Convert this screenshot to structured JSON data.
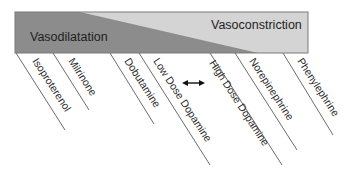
{
  "diagram": {
    "zones": {
      "left": {
        "label": "Vasodilatation",
        "color": "#8c8c8c"
      },
      "right": {
        "label": "Vasoconstriction",
        "color": "#d4d4d4"
      }
    },
    "border_color": "#777777",
    "line_color": "#555555",
    "drugs": [
      {
        "label": "Isoproterenol"
      },
      {
        "label": "Milrinone"
      },
      {
        "label": "Dobutamine"
      },
      {
        "label": "Low Dose Dopamine"
      },
      {
        "label": "High Dose Dopamine"
      },
      {
        "label": "Norepinephrine"
      },
      {
        "label": "Phenylephrine"
      }
    ],
    "arrow": {
      "meaning": "dose-dependent transition between low and high dose dopamine",
      "icon": "double-headed-arrow-icon"
    }
  }
}
